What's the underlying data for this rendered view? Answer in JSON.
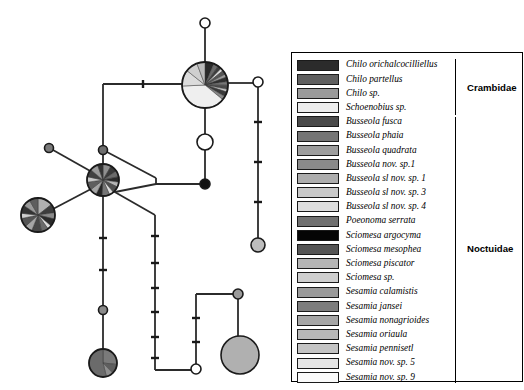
{
  "figure": {
    "type": "haplotype-network",
    "width": 524,
    "height": 390,
    "background": "#ffffff"
  },
  "legend": {
    "panel_border_color": "#000000",
    "entries": [
      {
        "label": "Chilo orichalcocilliellus",
        "color": "#2b2b2b",
        "family": "Crambidae"
      },
      {
        "label": "Chilo partellus",
        "color": "#5e5e5e",
        "family": "Crambidae"
      },
      {
        "label": "Chilo sp.",
        "color": "#9a9a9a",
        "family": "Crambidae"
      },
      {
        "label": "Schoenobius sp.",
        "color": "#ededed",
        "family": "Crambidae"
      },
      {
        "label": "Busseola fusca",
        "color": "#4a4a4a",
        "family": "Noctuidae"
      },
      {
        "label": "Busseola phaia",
        "color": "#757575",
        "family": "Noctuidae"
      },
      {
        "label": "Busseola quadrata",
        "color": "#9d9d9d",
        "family": "Noctuidae"
      },
      {
        "label": "Busseola nov. sp.1",
        "color": "#8a8a8a",
        "family": "Noctuidae"
      },
      {
        "label": "Busseola sl nov. sp. 1",
        "color": "#adadad",
        "family": "Noctuidae"
      },
      {
        "label": "Busseola sl nov. sp. 3",
        "color": "#c9c9c9",
        "family": "Noctuidae"
      },
      {
        "label": "Busseola sl nov. sp. 4",
        "color": "#dedede",
        "family": "Noctuidae"
      },
      {
        "label": "Poeonoma serrata",
        "color": "#707070",
        "family": "Noctuidae"
      },
      {
        "label": "Sciomesa argocyma",
        "color": "#050505",
        "family": "Noctuidae"
      },
      {
        "label": "Sciomesa mesophea",
        "color": "#555555",
        "family": "Noctuidae"
      },
      {
        "label": "Sciomesa piscator",
        "color": "#b5b5b5",
        "family": "Noctuidae"
      },
      {
        "label": "Sciomesa sp.",
        "color": "#cfcfcf",
        "family": "Noctuidae"
      },
      {
        "label": "Sesamia calamistis",
        "color": "#9a9a9a",
        "family": "Noctuidae"
      },
      {
        "label": "Sesamia jansei",
        "color": "#7d7d7d",
        "family": "Noctuidae"
      },
      {
        "label": "Sesamia nonagrioides",
        "color": "#a5a5a5",
        "family": "Noctuidae"
      },
      {
        "label": "Sesamia oriaula",
        "color": "#b8b8b8",
        "family": "Noctuidae"
      },
      {
        "label": "Sesamia pennisetl",
        "color": "#c4c4c4",
        "family": "Noctuidae"
      },
      {
        "label": "Sesamia nov. sp. 5",
        "color": "#e6e6e6",
        "family": "Noctuidae"
      },
      {
        "label": "Sesamia nov. sp. 9",
        "color": "#fafafa",
        "family": "Noctuidae"
      }
    ],
    "families": [
      {
        "name": "Crambidae",
        "start_index": 0,
        "end_index": 3
      },
      {
        "name": "Noctuidae",
        "start_index": 4,
        "end_index": 22
      }
    ]
  },
  "network": {
    "stroke_color": "#2b2b2b",
    "node_outline": "#1a1a1a",
    "nodes": [
      {
        "id": "n-top-white",
        "cx": 205,
        "cy": 23,
        "r": 5,
        "fill": "#ffffff",
        "kind": "circle"
      },
      {
        "id": "n-main-pie",
        "cx": 205,
        "cy": 85,
        "r": 23,
        "kind": "pie"
      },
      {
        "id": "n-right-white",
        "cx": 258,
        "cy": 82,
        "r": 5,
        "fill": "#ffffff",
        "kind": "circle"
      },
      {
        "id": "n-right-half",
        "cx": 258,
        "cy": 245,
        "r": 7,
        "fill": "#bdbdbd",
        "kind": "circle"
      },
      {
        "id": "n-mid-white",
        "cx": 205,
        "cy": 142,
        "r": 8,
        "fill": "#ffffff",
        "kind": "circle"
      },
      {
        "id": "n-mid-black",
        "cx": 205,
        "cy": 184,
        "r": 5,
        "fill": "#111111",
        "kind": "circle"
      },
      {
        "id": "n-junction-grey",
        "cx": 103,
        "cy": 150,
        "r": 4.5,
        "fill": "#6e6e6e",
        "kind": "circle"
      },
      {
        "id": "n-left-small-grey",
        "cx": 49,
        "cy": 148,
        "r": 4.5,
        "fill": "#7a7a7a",
        "kind": "circle"
      },
      {
        "id": "n-hub-pie",
        "cx": 103,
        "cy": 180,
        "r": 16,
        "kind": "pie"
      },
      {
        "id": "n-left-pie",
        "cx": 38,
        "cy": 215,
        "r": 17,
        "kind": "pie"
      },
      {
        "id": "n-bottom-pie",
        "cx": 103,
        "cy": 363,
        "r": 14,
        "kind": "pie"
      },
      {
        "id": "n-mid-stem-grey",
        "cx": 103,
        "cy": 310,
        "r": 4.5,
        "fill": "#8a8a8a",
        "kind": "circle"
      },
      {
        "id": "n-br-small-grey",
        "cx": 238,
        "cy": 294,
        "r": 5,
        "fill": "#9a9a9a",
        "kind": "circle"
      },
      {
        "id": "n-br-big-grey",
        "cx": 240,
        "cy": 355,
        "r": 19,
        "fill": "#b0b0b0",
        "kind": "circle"
      },
      {
        "id": "n-bottom-white",
        "cx": 196,
        "cy": 369,
        "r": 5,
        "fill": "#ffffff",
        "kind": "circle"
      }
    ],
    "pie_wedges": {
      "n-main-pie": [
        {
          "color": "#2b2b2b",
          "span": 22
        },
        {
          "color": "#6b6b6b",
          "span": 12
        },
        {
          "color": "#3d3d3d",
          "span": 9
        },
        {
          "color": "#dcdcdc",
          "span": 7
        },
        {
          "color": "#555555",
          "span": 10
        },
        {
          "color": "#9a9a9a",
          "span": 8
        },
        {
          "color": "#2f2f2f",
          "span": 11
        },
        {
          "color": "#777777",
          "span": 9
        },
        {
          "color": "#4a4a4a",
          "span": 10
        },
        {
          "color": "#c4c4c4",
          "span": 7
        },
        {
          "color": "#3a3a3a",
          "span": 12
        },
        {
          "color": "#8a8a8a",
          "span": 9
        },
        {
          "color": "#efefef",
          "span": 134
        },
        {
          "color": "#dcdcdc",
          "span": 40
        },
        {
          "color": "#cfcfcf",
          "span": 30
        },
        {
          "color": "#bdbdbd",
          "span": 20
        }
      ],
      "n-hub-pie": [
        {
          "color": "#8f8f8f",
          "span": 30
        },
        {
          "color": "#3a3a3a",
          "span": 26
        },
        {
          "color": "#6b6b6b",
          "span": 22
        },
        {
          "color": "#2b2b2b",
          "span": 20
        },
        {
          "color": "#b5b5b5",
          "span": 18
        },
        {
          "color": "#4f4f4f",
          "span": 24
        },
        {
          "color": "#dcdcdc",
          "span": 16
        },
        {
          "color": "#757575",
          "span": 28
        },
        {
          "color": "#262626",
          "span": 22
        },
        {
          "color": "#a5a5a5",
          "span": 26
        },
        {
          "color": "#5e5e5e",
          "span": 30
        },
        {
          "color": "#c9c9c9",
          "span": 20
        },
        {
          "color": "#414141",
          "span": 28
        },
        {
          "color": "#9a9a9a",
          "span": 30
        },
        {
          "color": "#333333",
          "span": 20
        }
      ],
      "n-left-pie": [
        {
          "color": "#b0b0b0",
          "span": 52
        },
        {
          "color": "#3d3d3d",
          "span": 30
        },
        {
          "color": "#8a8a8a",
          "span": 22
        },
        {
          "color": "#2b2b2b",
          "span": 26
        },
        {
          "color": "#dcdcdc",
          "span": 14
        },
        {
          "color": "#6b6b6b",
          "span": 24
        },
        {
          "color": "#474747",
          "span": 34
        },
        {
          "color": "#a5a5a5",
          "span": 26
        },
        {
          "color": "#555555",
          "span": 30
        },
        {
          "color": "#cfcfcf",
          "span": 18
        },
        {
          "color": "#333333",
          "span": 28
        },
        {
          "color": "#9a9a9a",
          "span": 26
        },
        {
          "color": "#5e5e5e",
          "span": 30
        }
      ],
      "n-bottom-pie": [
        {
          "color": "#7a7a7a",
          "span": 96
        },
        {
          "color": "#5e5e5e",
          "span": 40
        },
        {
          "color": "#8f8f8f",
          "span": 30
        },
        {
          "color": "#6b6b6b",
          "span": 194
        }
      ]
    },
    "edges": [
      {
        "from": "n-top-white",
        "to": "n-main-pie",
        "ticks": 0
      },
      {
        "from": "n-main-pie",
        "to": "n-mid-white",
        "ticks": 0
      },
      {
        "from": "n-mid-white",
        "to": "n-mid-black",
        "ticks": 0
      },
      {
        "from": "n-main-pie",
        "to": "n-right-white",
        "ticks": 0
      },
      {
        "from": "n-right-white",
        "to": "n-right-half",
        "ticks": 3
      }
    ],
    "tick_marks_total": 24
  }
}
